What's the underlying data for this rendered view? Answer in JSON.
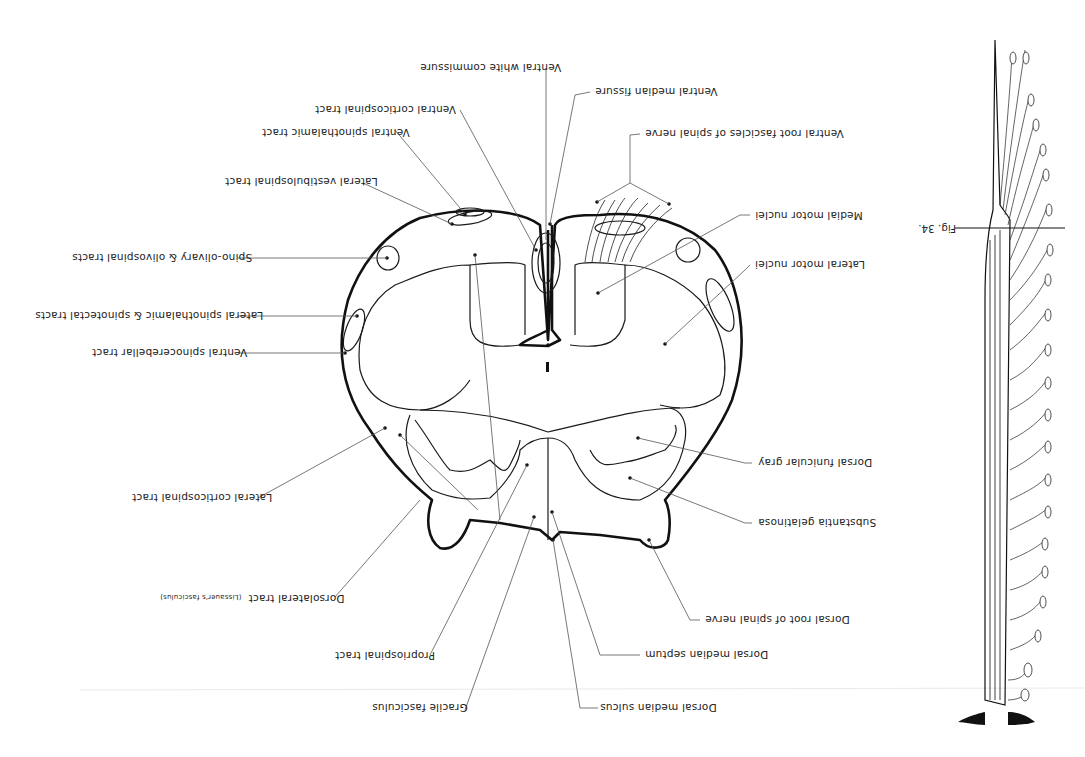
{
  "figure": {
    "orientation": "rotated 180 degrees",
    "title": "Fig. 34."
  },
  "labels": {
    "ventral_white_commissure": "Ventral white commissure",
    "ventral_median_fissure": "Ventral median fissure",
    "ventral_corticospinal_tract": "Ventral corticospinal tract",
    "ventral_spinothalamic_tract": "Ventral spinothalamic tract",
    "ventral_root_fascicles": "Ventral root fascicles of spinal nerve",
    "lateral_vestibulospinal_tract": "Lateral vestibulospinal tract",
    "medial_motor_nuclei": "Medial motor nuclei",
    "spino_olivary": "Spino-olivary & olivospinal tracts",
    "lateral_motor_nuclei": "Lateral motor nuclei",
    "lateral_spinothalamic": "Lateral spinothalamic & spinotectal tracts",
    "ventral_spinocerebellar": "Ventral spinocerebellar tract",
    "dorsal_funicular_gray": "Dorsal funicular gray",
    "lateral_corticospinal": "Lateral corticospinal tract",
    "substantia_gelatinosa": "Substantia gelatinosa",
    "dorsolateral_tract": "Dorsolateral tract",
    "dorsolateral_tract_alt": "(Lissauer's fasciculus)",
    "dorsal_root": "Dorsal root of spinal nerve",
    "dorsal_median_septum": "Dorsal median septum",
    "propriospinal_tract": "Propriospinal tract",
    "gracile_fasciculus": "Gracile fasciculus",
    "dorsal_median_sulcus": "Dorsal median sulcus"
  }
}
